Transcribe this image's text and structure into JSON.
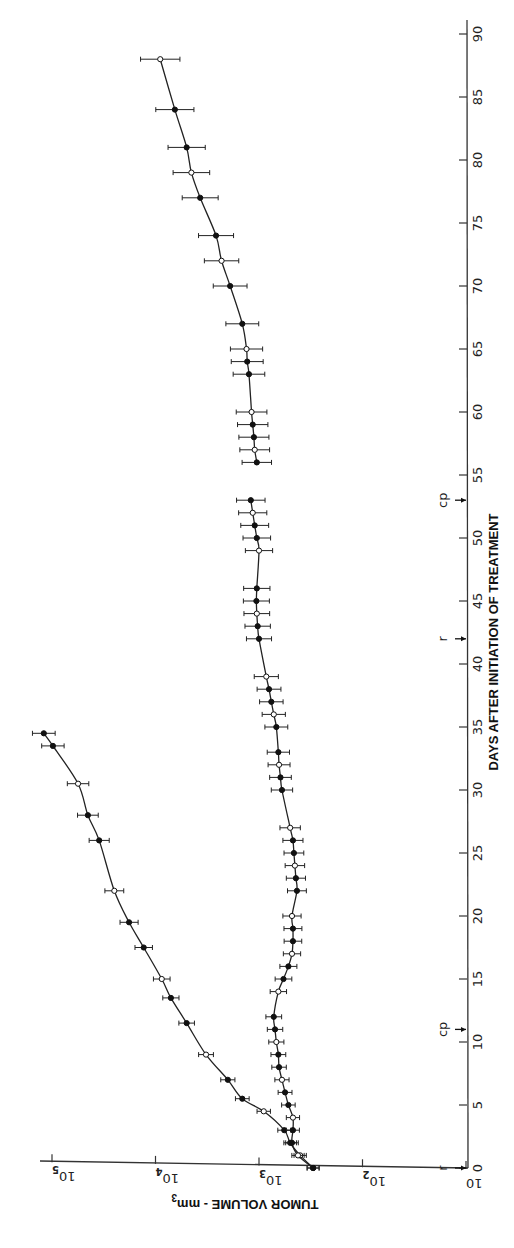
{
  "chart_data": {
    "type": "line",
    "orientation": "rotated 90° (figure printed sideways: days axis runs vertically on the right, volume axis runs horizontally along the bottom)",
    "title": "",
    "xlabel": "DAYS AFTER INITIATION OF TREATMENT",
    "ylabel": "TUMOR VOLUME - mm³",
    "xlim": [
      0,
      90
    ],
    "ylim": [
      10,
      100000
    ],
    "yscale": "log",
    "x_ticks": [
      0,
      5,
      10,
      15,
      20,
      25,
      30,
      35,
      40,
      45,
      50,
      55,
      60,
      65,
      70,
      75,
      80,
      85,
      90
    ],
    "y_ticks": [
      "10",
      "10²",
      "10³",
      "10⁴",
      "10⁵"
    ],
    "y_tick_values": [
      10,
      100,
      1000,
      10000,
      100000
    ],
    "grid": false,
    "legend": null,
    "annotations": [
      {
        "label": "r",
        "day": 0
      },
      {
        "label": "cp",
        "day": 11
      },
      {
        "label": "r",
        "day": 42
      },
      {
        "label": "cp",
        "day": 53
      }
    ],
    "series": [
      {
        "name": "Control (untreated)",
        "error_bars": true,
        "x": [
          0,
          1,
          2,
          3,
          4.5,
          5.5,
          7,
          9,
          11.5,
          13.5,
          15,
          17.5,
          19.5,
          22,
          26,
          28,
          30.5,
          33.5,
          34.5
        ],
        "y": [
          300,
          400,
          500,
          570,
          900,
          1450,
          2000,
          3250,
          5000,
          7100,
          8700,
          13000,
          18000,
          25000,
          35000,
          45000,
          56000,
          98000,
          120000
        ]
      },
      {
        "name": "Treated",
        "error_bars": true,
        "x": [
          0,
          1,
          2,
          3,
          4,
          5,
          6,
          7,
          8,
          9,
          10,
          11,
          12,
          14,
          15,
          16,
          17,
          18,
          19,
          20,
          22,
          23,
          24,
          25,
          26,
          27,
          30,
          31,
          32,
          33,
          35,
          36,
          37,
          38,
          39,
          42,
          43,
          44,
          45,
          46,
          49,
          50,
          51,
          52,
          53
        ],
        "y": [
          300,
          420,
          480,
          470,
          470,
          520,
          560,
          600,
          640,
          650,
          680,
          700,
          720,
          650,
          580,
          520,
          480,
          470,
          470,
          480,
          430,
          440,
          450,
          460,
          470,
          500,
          600,
          620,
          640,
          650,
          680,
          720,
          760,
          800,
          850,
          1000,
          1030,
          1050,
          1060,
          1050,
          1000,
          1050,
          1100,
          1150,
          1200
        ]
      },
      {
        "name": "Treated (after day 55)",
        "error_bars": true,
        "x": [
          56,
          57,
          58,
          59,
          60,
          63,
          64,
          65,
          67,
          70,
          72,
          74,
          77,
          79,
          81,
          84,
          88
        ],
        "y": [
          1050,
          1100,
          1120,
          1150,
          1180,
          1250,
          1300,
          1320,
          1450,
          1900,
          2300,
          2600,
          3700,
          4500,
          5000,
          6500,
          9000
        ]
      }
    ]
  },
  "axes": {
    "x_title": "DAYS AFTER INITIATION OF TREATMENT",
    "y_title_main": "TUMOR VOLUME - mm",
    "y_title_sup": "3",
    "y_tick_base": "10",
    "y_tick_exps": [
      "",
      "2",
      "3",
      "4",
      "5"
    ]
  }
}
